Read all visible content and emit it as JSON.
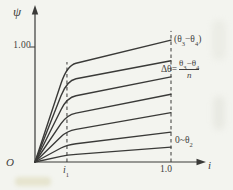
{
  "chart_data": {
    "type": "line",
    "xlabel": "i",
    "ylabel": "ψ",
    "x_range": [
      0,
      1.22
    ],
    "y_range": [
      0,
      1.36
    ],
    "grid": false,
    "x_ticks": [
      {
        "label": "i1",
        "value": 0.235
      },
      {
        "label": "1.0",
        "value": 1.0
      }
    ],
    "y_ticks": [
      {
        "label": "1.00",
        "value": 1.0
      }
    ],
    "origin_label": "O",
    "dashed_guides": [
      {
        "x": 0.235,
        "y_top": 0.87
      },
      {
        "x": 1.0,
        "y_top": 1.14
      }
    ],
    "curves": [
      {
        "name": "theta3-theta4",
        "points": [
          [
            0,
            0
          ],
          [
            0.235,
            0.84
          ],
          [
            1.0,
            1.06
          ]
        ]
      },
      {
        "name": "step-2",
        "points": [
          [
            0,
            0
          ],
          [
            0.235,
            0.71
          ],
          [
            1.0,
            0.88
          ]
        ]
      },
      {
        "name": "step-3",
        "points": [
          [
            0,
            0
          ],
          [
            0.235,
            0.56
          ],
          [
            1.0,
            0.74
          ]
        ]
      },
      {
        "name": "step-4",
        "points": [
          [
            0,
            0
          ],
          [
            0.235,
            0.41
          ],
          [
            1.0,
            0.59
          ]
        ]
      },
      {
        "name": "step-5",
        "points": [
          [
            0,
            0
          ],
          [
            0.235,
            0.27
          ],
          [
            1.0,
            0.43
          ]
        ]
      },
      {
        "name": "step-6",
        "points": [
          [
            0,
            0
          ],
          [
            0.235,
            0.15
          ],
          [
            1.0,
            0.26
          ]
        ]
      },
      {
        "name": "0-theta2",
        "points": [
          [
            0,
            0
          ],
          [
            0.235,
            0.06
          ],
          [
            1.0,
            0.13
          ]
        ]
      }
    ],
    "annotations": [
      {
        "text": "(θ3−θ4)",
        "position": "right-of-top-curve"
      },
      {
        "text": "Δθ=(θ3−θ4)/n",
        "position": "right-middle"
      },
      {
        "text": "0~θ2",
        "position": "right-of-bottom-curve"
      }
    ],
    "line_color": "#3a3a38",
    "background": "#f3f4ef"
  },
  "labels": {
    "psi": "ψ",
    "y_tick_1": "1.00",
    "origin": "O",
    "x_tick_i1_base": "i",
    "x_tick_i1_sub": "1",
    "x_tick_1": "1.0",
    "x_axis": "i",
    "ann_top": {
      "open": "(θ",
      "sub1": "3",
      "mid": "−θ",
      "sub2": "4",
      "close": ")"
    },
    "ann_delta": {
      "pre": "Δθ=",
      "num_base1": "θ",
      "num_sub1": "3",
      "num_mid": "−θ",
      "num_sub2": "4",
      "den": "n"
    },
    "ann_bottom": {
      "pre": "0~θ",
      "sub": "2"
    }
  }
}
